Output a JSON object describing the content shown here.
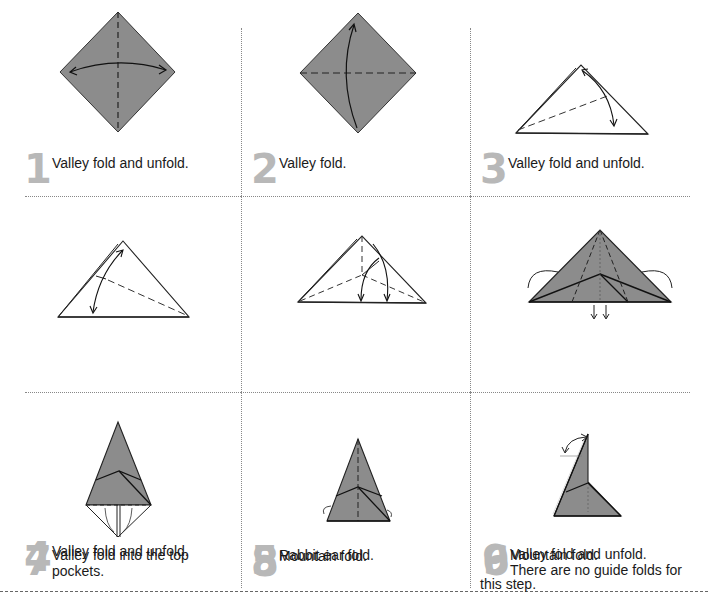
{
  "colors": {
    "paper": "#8c8c8c",
    "step_number": "#b8b8b8",
    "line": "#222222"
  },
  "steps": [
    {
      "number": "1",
      "text": "Valley fold and unfold.",
      "diagram": "square-diamond-vertical-valley-crease"
    },
    {
      "number": "2",
      "text": "Valley fold.",
      "diagram": "square-diamond-horizontal-valley-fold"
    },
    {
      "number": "3",
      "text": "Valley fold and unfold.",
      "diagram": "triangle-angle-bisector-crease"
    },
    {
      "number": "4",
      "text": "Valley fold and unfold.",
      "diagram": "triangle-angle-bisector-crease-right"
    },
    {
      "number": "5",
      "text": "Rabbit ear fold.",
      "diagram": "triangle-rabbit-ear"
    },
    {
      "number": "6",
      "text": "Mountain fold.",
      "diagram": "colored-triangle-mountain-fold"
    },
    {
      "number": "7",
      "text": "Valley fold into the top pockets.",
      "diagram": "kite-valley-fold-into-pockets"
    },
    {
      "number": "8",
      "text": "Mountain fold.",
      "diagram": "tall-triangle-mountain-fold"
    },
    {
      "number": "9",
      "text_line1": "Valley fold and unfold.",
      "text_line2": "There are no guide folds for",
      "text_line3": "this step.",
      "diagram": "bird-shape-valley-fold"
    }
  ]
}
